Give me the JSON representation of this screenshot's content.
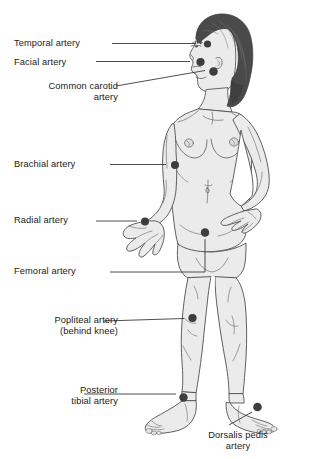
{
  "figure": {
    "colors": {
      "skin_fill": "#ebebeb",
      "skin_shade": "#dedede",
      "outline": "#4f4f4f",
      "hair": "#4a4a4a",
      "hair_highlight": "#6e6e6e",
      "marker": "#3d3d3d",
      "leader_line": "#3a3a3a",
      "text": "#1a1a1a",
      "background": "#ffffff"
    },
    "marker_count": 9
  },
  "labels": [
    {
      "id": "temporal",
      "text": "Temporal artery",
      "align": "left",
      "x": 14,
      "y": 38,
      "marker": {
        "x": 207.5,
        "y": 44.0,
        "r": 3.6
      },
      "leader": "M112,43.5 L196,43.5"
    },
    {
      "id": "facial",
      "text": "Facial artery",
      "align": "left",
      "x": 14,
      "y": 57,
      "marker": {
        "x": 200.5,
        "y": 62.0,
        "r": 4.1
      },
      "leader": "M96,61.5 L190,61.5"
    },
    {
      "id": "carotid",
      "text": "Common carotid\nartery",
      "align": "right",
      "x": 14,
      "y": 81,
      "marker": {
        "x": 213.5,
        "y": 71.5,
        "r": 4.3
      },
      "leader": "M116,86 L205,70.5"
    },
    {
      "id": "brachial",
      "text": "Brachial artery",
      "align": "left",
      "x": 14,
      "y": 159,
      "marker": {
        "x": 175.0,
        "y": 165.0,
        "r": 4.0
      },
      "leader": "M110,164.5 L166,164.5"
    },
    {
      "id": "radial",
      "text": "Radial artery",
      "align": "left",
      "x": 14,
      "y": 215,
      "marker": {
        "x": 145.0,
        "y": 221.5,
        "r": 4.0
      },
      "leader": "M96,221 L137,221"
    },
    {
      "id": "femoral",
      "text": "Femoral artery",
      "align": "left",
      "x": 14,
      "y": 266,
      "marker": {
        "x": 205.0,
        "y": 232.5,
        "r": 4.2
      },
      "leader": "M110,272 L205,272 L205,239"
    },
    {
      "id": "popliteal",
      "text": "Popliteal artery\n(behind knee)",
      "align": "right",
      "x": 14,
      "y": 315,
      "marker": {
        "x": 192.5,
        "y": 318.0,
        "r": 4.1
      },
      "leader": "M104,321 L184,318.5"
    },
    {
      "id": "tibial",
      "text": "Posterior\ntibial artery",
      "align": "right",
      "x": 14,
      "y": 385,
      "marker": {
        "x": 183.5,
        "y": 397.5,
        "r": 4.2
      },
      "leader": "M84,394 L176,394"
    },
    {
      "id": "dorsalis",
      "text": "Dorsalis pedis\nartery",
      "align": "center",
      "x": 186,
      "y": 430,
      "marker": {
        "x": 257.5,
        "y": 407.0,
        "r": 4.3
      },
      "leader": "M229,425 L252,412"
    }
  ]
}
